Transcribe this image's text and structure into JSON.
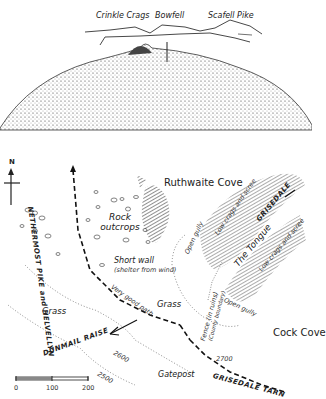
{
  "view": {
    "peaks": [
      "Crinkle Crags",
      "Bowfell",
      "Scafell Pike"
    ]
  },
  "map": {
    "north_label": "N",
    "areas": {
      "ruthwaite_cove": "Ruthwaite Cove",
      "cock_cove": "Cock Cove"
    },
    "labels": {
      "rock_outcrops": "Rock outcrops",
      "short_wall": "Short wall",
      "shelter": "(shelter from wind)",
      "open_gully_1": "Open gully",
      "open_gully_2": "Open gully",
      "low_crags_1": "Low crags and scree",
      "low_crags_2": "Low crags and scree",
      "the_tongue": "The Tongue",
      "grass_1": "Grass",
      "grass_2": "Grass",
      "very_good_path": "Very good path",
      "fence": "Fence (in ruins)",
      "county_boundary": "(County boundary)",
      "gatepost": "Gatepost"
    },
    "routes": {
      "nethermost": "NETHERMOST PIKE and HELVELLYN",
      "grisedale": "GRISEDALE",
      "dunmail": "DUNMAIL RAISE",
      "grisedale_tarn": "GRISEDALE TARN"
    },
    "contours": [
      "2700",
      "2600",
      "2500"
    ],
    "scale": {
      "ticks": [
        "0",
        "100",
        "200"
      ]
    }
  }
}
